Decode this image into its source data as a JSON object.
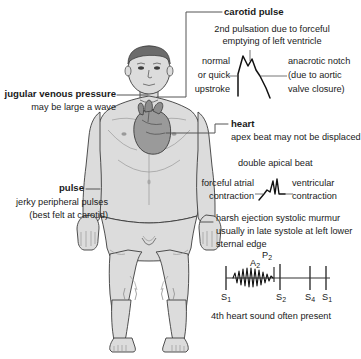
{
  "diagram": {
    "colors": {
      "skin": "#dcdcdc",
      "skin_shadow": "#c9c9c9",
      "hair": "#6b6b6b",
      "heart": "#9a9a9a",
      "outline": "#3c3c3c",
      "leader": "#555555",
      "text": "#1a1a1a",
      "trace": "#111111"
    },
    "figure_name": "anterior male body with heart"
  },
  "annotations": {
    "carotid": {
      "title": "carotid pulse",
      "caption_line1": "2nd pulsation due to forceful",
      "caption_line2": "emptying of left ventricle",
      "left_line1": "normal",
      "left_line2": "or quick",
      "left_line3": "upstroke",
      "right_line1": "anacrotic notch",
      "right_line2": "(due to aortic",
      "right_line3": "valve closure)"
    },
    "jvp": {
      "title": "jugular venous pressure",
      "caption": "may be large a wave"
    },
    "heart": {
      "title": "heart",
      "caption": "apex beat may not be displaced",
      "apical_title": "double apical beat",
      "left_line1": "forceful atrial",
      "left_line2": "contraction",
      "right_line1": "ventricular",
      "right_line2": "contraction"
    },
    "pulse": {
      "title": "pulse",
      "caption_line1": "jerky peripheral pulses",
      "caption_line2": "(best felt at carotid)"
    },
    "murmur": {
      "line1": "harsh ejection systolic murmur",
      "line2": "usually in late systole at left lower",
      "line3": "sternal edge"
    },
    "heart_sounds": {
      "s1_first": "S",
      "s1_first_sub": "1",
      "a2": "A",
      "a2_sub": "2",
      "p2": "P",
      "p2_sub": "2",
      "s2": "S",
      "s2_sub": "2",
      "s4": "S",
      "s4_sub": "4",
      "s1_last": "S",
      "s1_last_sub": "1",
      "footer": "4th heart sound often present"
    }
  }
}
